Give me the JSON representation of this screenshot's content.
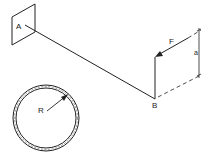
{
  "diagram": {
    "labels": {
      "point_a": "A",
      "point_b": "B",
      "force": "F",
      "dimension": "a",
      "radius": "R"
    },
    "colors": {
      "stroke": "#222222",
      "background": "#ffffff"
    }
  }
}
